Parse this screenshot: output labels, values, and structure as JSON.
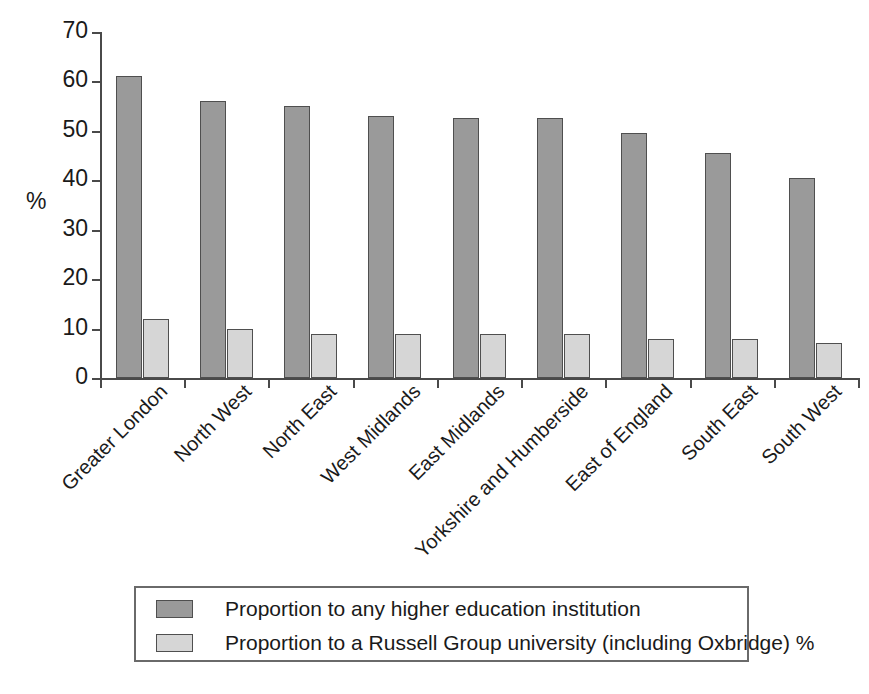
{
  "chart_data": {
    "type": "bar",
    "title": "",
    "xlabel": "",
    "ylabel": "%",
    "ylim": [
      0,
      70
    ],
    "yticks": [
      0,
      10,
      20,
      30,
      40,
      50,
      60,
      70
    ],
    "grid": false,
    "legend_position": "bottom",
    "categories": [
      "Greater London",
      "North West",
      "North East",
      "West Midlands",
      "East Midlands",
      "Yorkshire and Humberside",
      "East of England",
      "South East",
      "South West"
    ],
    "series": [
      {
        "name": "Proportion to any higher education institution",
        "color": "#9a9a9a",
        "values": [
          61,
          56,
          55,
          53,
          52.5,
          52.5,
          49.5,
          45.5,
          40.5
        ]
      },
      {
        "name": "Proportion to a Russell Group university (including Oxbridge) %",
        "color": "#d6d6d6",
        "values": [
          12,
          10,
          9,
          9,
          9,
          9,
          7.8,
          7.8,
          7
        ]
      }
    ]
  },
  "axis": {
    "y_title": "%",
    "y_tick_labels": [
      "0",
      "10",
      "20",
      "30",
      "40",
      "50",
      "60",
      "70"
    ]
  },
  "legend": {
    "entries": [
      {
        "label": "Proportion to any higher education institution",
        "swatch": "#9a9a9a"
      },
      {
        "label": "Proportion to a Russell Group university (including Oxbridge) %",
        "swatch": "#d6d6d6"
      }
    ]
  },
  "colors": {
    "series_any_he": "#9a9a9a",
    "series_russell": "#d6d6d6",
    "axis": "#4a4a4a",
    "text": "#1a1a1a",
    "background": "#ffffff"
  }
}
